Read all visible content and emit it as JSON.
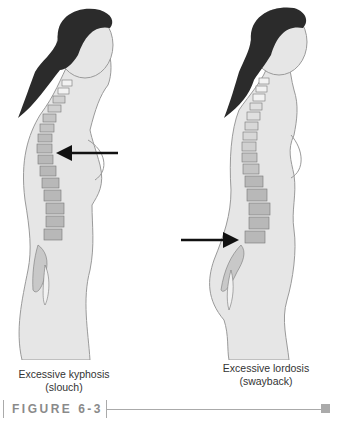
{
  "figure": {
    "label": "FIGURE 6-3",
    "panels": [
      {
        "title": "Excessive kyphosis",
        "subtitle": "(slouch)",
        "arrow_direction": "left",
        "arrow_target": "upper back (thoracic spine)"
      },
      {
        "title": "Excessive lordosis",
        "subtitle": "(swayback)",
        "arrow_direction": "right",
        "arrow_target": "lower back (lumbar spine)"
      }
    ]
  },
  "colors": {
    "hair": "#2b2b2b",
    "skin": "#e6e6e6",
    "outline": "#9a9a9a",
    "vertebra_dark": "#b8b8b8",
    "vertebra_light": "#f2f2f2",
    "arrow": "#111111",
    "rule": "#aaaaaa"
  }
}
